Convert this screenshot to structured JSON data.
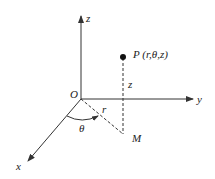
{
  "diagram": {
    "type": "cylindrical-coordinates",
    "colors": {
      "line": "#333333",
      "text": "#222222",
      "background": "#ffffff"
    },
    "axes": {
      "z": {
        "label": "z"
      },
      "y": {
        "label": "y"
      },
      "x": {
        "label": "x"
      }
    },
    "origin": {
      "label": "O"
    },
    "point": {
      "label": "P (r,θ,z)"
    },
    "projection": {
      "label": "M"
    },
    "radius": {
      "label": "r"
    },
    "angle": {
      "label": "θ"
    },
    "height": {
      "label": "z"
    }
  }
}
